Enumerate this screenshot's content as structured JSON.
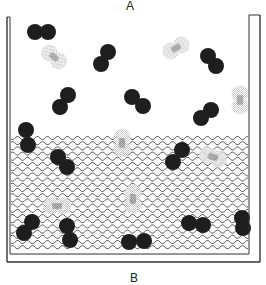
{
  "diagram": {
    "labels": {
      "top": "A",
      "bottom": "B"
    },
    "colors": {
      "molecule": "#1e1e1e",
      "ghost_fill": "#d6d6d6",
      "ghost_core": "#8a8a8a",
      "wave": "#555555",
      "wall": "#333333"
    },
    "container": {
      "outer": {
        "left": 7,
        "right": 260,
        "top_left": 17,
        "top_right": 15,
        "bottom": 262
      },
      "inner": {
        "left": 10,
        "right": 249,
        "bottom": 254
      }
    },
    "liquid": {
      "top": 138,
      "bottom": 250,
      "line_spacing": 5.2,
      "wavelength": 10,
      "amplitude": 1.6
    },
    "molecule_radius": 8,
    "molecules": [
      {
        "a": [
          35,
          32
        ],
        "b": [
          48,
          32
        ],
        "phase": "gas"
      },
      {
        "a": [
          101,
          64
        ],
        "b": [
          108,
          52
        ],
        "phase": "gas"
      },
      {
        "a": [
          60,
          107
        ],
        "b": [
          68,
          95
        ],
        "phase": "gas"
      },
      {
        "a": [
          132,
          97
        ],
        "b": [
          143,
          106
        ],
        "phase": "gas"
      },
      {
        "a": [
          208,
          56
        ],
        "b": [
          216,
          66
        ],
        "phase": "gas"
      },
      {
        "a": [
          201,
          118
        ],
        "b": [
          211,
          110
        ],
        "phase": "gas"
      },
      {
        "a": [
          26,
          130
        ],
        "b": [
          28,
          145
        ],
        "phase": "liquid"
      },
      {
        "a": [
          58,
          157
        ],
        "b": [
          67,
          167
        ],
        "phase": "liquid"
      },
      {
        "a": [
          173,
          162
        ],
        "b": [
          182,
          150
        ],
        "phase": "liquid"
      },
      {
        "a": [
          24,
          233
        ],
        "b": [
          32,
          222
        ],
        "phase": "liquid"
      },
      {
        "a": [
          67,
          226
        ],
        "b": [
          70,
          240
        ],
        "phase": "liquid"
      },
      {
        "a": [
          129,
          242
        ],
        "b": [
          144,
          241
        ],
        "phase": "liquid"
      },
      {
        "a": [
          189,
          223
        ],
        "b": [
          203,
          225
        ],
        "phase": "liquid"
      },
      {
        "a": [
          242,
          218
        ],
        "b": [
          243,
          228
        ],
        "phase": "liquid"
      }
    ],
    "ghost_molecules": [
      {
        "cx": 54,
        "cy": 57,
        "angle": 40
      },
      {
        "cx": 176,
        "cy": 48,
        "angle": -30
      },
      {
        "cx": 240,
        "cy": 100,
        "angle": 90
      },
      {
        "cx": 122,
        "cy": 143,
        "angle": 90
      },
      {
        "cx": 213,
        "cy": 157,
        "angle": 20
      },
      {
        "cx": 57,
        "cy": 206,
        "angle": 0
      },
      {
        "cx": 133,
        "cy": 199,
        "angle": 90
      }
    ]
  }
}
